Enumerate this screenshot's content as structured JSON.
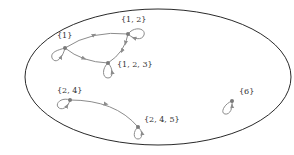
{
  "diagram": {
    "type": "directed-graph",
    "colors": {
      "ellipse_stroke": "#2a2a2a",
      "edge_stroke": "#8c8c8c",
      "node_fill": "#7a7a7a",
      "label_text": "#333333"
    },
    "nodes": [
      {
        "id": "n1",
        "label": "{1}",
        "x": 65,
        "y": 48
      },
      {
        "id": "n12",
        "label": "{1, 2}",
        "x": 128,
        "y": 34
      },
      {
        "id": "n123",
        "label": "{1, 2, 3}",
        "x": 108,
        "y": 63
      },
      {
        "id": "n24",
        "label": "{2, 4}",
        "x": 70,
        "y": 100
      },
      {
        "id": "n245",
        "label": "{2, 4, 5}",
        "x": 138,
        "y": 127
      },
      {
        "id": "n6",
        "label": "{6}",
        "x": 232,
        "y": 101
      }
    ],
    "edges": [
      {
        "from": "{1}",
        "to": "{1, 2}"
      },
      {
        "from": "{1}",
        "to": "{1, 2, 3}"
      },
      {
        "from": "{1, 2}",
        "to": "{1, 2, 3}"
      },
      {
        "from": "{2, 4}",
        "to": "{2, 4, 5}"
      },
      {
        "from": "{1}",
        "to": "{1}",
        "self_loop": true
      },
      {
        "from": "{1, 2}",
        "to": "{1, 2}",
        "self_loop": true
      },
      {
        "from": "{1, 2, 3}",
        "to": "{1, 2, 3}",
        "self_loop": true
      },
      {
        "from": "{2, 4}",
        "to": "{2, 4}",
        "self_loop": true
      },
      {
        "from": "{2, 4, 5}",
        "to": "{2, 4, 5}",
        "self_loop": true
      },
      {
        "from": "{6}",
        "to": "{6}",
        "self_loop": true
      }
    ]
  }
}
